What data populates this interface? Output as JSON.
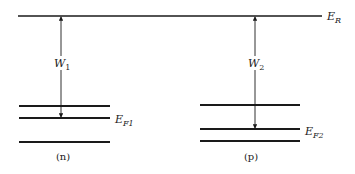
{
  "diagram": {
    "type": "energy-level-diagram",
    "colors": {
      "line": "#1a1a1a",
      "background": "#ffffff"
    },
    "reference_level": {
      "label": "E",
      "subscript": "R",
      "y": 16,
      "x1": 18,
      "x2": 322,
      "label_x": 327
    },
    "panels": [
      {
        "id": "n",
        "caption": "(n)",
        "caption_x": 63,
        "caption_y": 160,
        "levels_x1": 19,
        "levels_x2": 110,
        "levels_y": [
          106,
          118,
          142
        ],
        "fermi_level": {
          "label": "E",
          "subscript": "F1",
          "y": 118,
          "label_x": 115,
          "label_y": 123
        },
        "work_function": {
          "label": "W",
          "subscript": "1",
          "arrow_x": 61,
          "y_top": 16,
          "y_bottom": 118,
          "label_y": 67
        }
      },
      {
        "id": "p",
        "caption": "(p)",
        "caption_x": 251,
        "caption_y": 160,
        "levels_x1": 200,
        "levels_x2": 300,
        "levels_y": [
          105,
          129,
          141
        ],
        "fermi_level": {
          "label": "E",
          "subscript": "F2",
          "y": 129,
          "label_x": 305,
          "label_y": 135
        },
        "work_function": {
          "label": "W",
          "subscript": "2",
          "arrow_x": 255,
          "y_top": 16,
          "y_bottom": 129,
          "label_y": 67
        }
      }
    ]
  }
}
